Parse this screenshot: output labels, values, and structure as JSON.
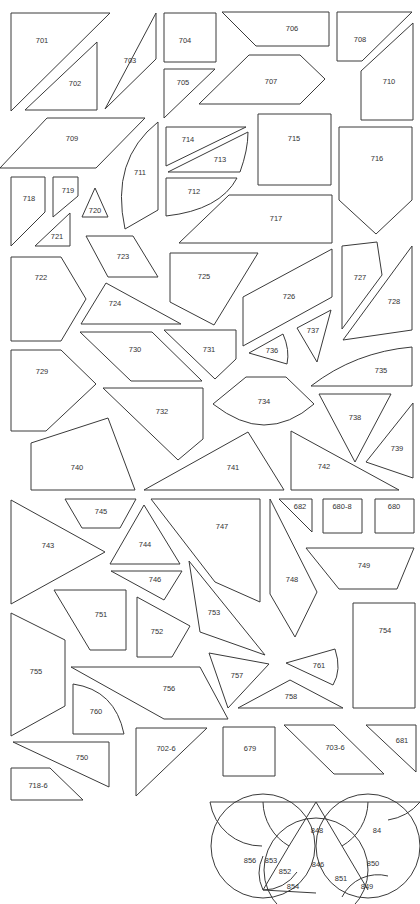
{
  "diagram": {
    "stroke_color": "#3a3a3a",
    "background": "#ffffff",
    "pieces": [
      {
        "id": "701",
        "points": "11,111 110,13 11,13",
        "lx": 42,
        "ly": 41
      },
      {
        "id": "702",
        "points": "25,110 97,42 97,110",
        "lx": 75,
        "ly": 84
      },
      {
        "id": "703",
        "points": "105,109 156,13 156,59",
        "lx": 130,
        "ly": 61
      },
      {
        "id": "704",
        "points": "164,13 216,13 216,62 164,62",
        "lx": 185,
        "ly": 41
      },
      {
        "id": "705",
        "points": "164,69 215,69 164,118",
        "lx": 183,
        "ly": 83
      },
      {
        "id": "706",
        "points": "222,12 329,12 329,46 256,46",
        "lx": 292,
        "ly": 29
      },
      {
        "id": "707",
        "points": "199,104 249,55 300,55 325,79 300,104",
        "lx": 271,
        "ly": 82
      },
      {
        "id": "708",
        "points": "337,12 412,12 362,61 337,61",
        "lx": 360,
        "ly": 40
      },
      {
        "id": "709",
        "points": "0,168 47,118 145,118 96,168",
        "lx": 72,
        "ly": 139
      },
      {
        "id": "710",
        "points": "361,71 413,23 413,120 361,120",
        "lx": 389,
        "ly": 82
      },
      {
        "id": "711",
        "points": "158,122 158,220",
        "curve": "M158,122 Q110,160 125,229 L158,210 Z",
        "lx": 140,
        "ly": 173
      },
      {
        "id": "712",
        "points": "166,178 237,178",
        "curve": "M166,178 L237,178 Q220,210 166,216 Z",
        "lx": 194,
        "ly": 192
      },
      {
        "id": "713",
        "points": "168,172 248,132",
        "curve": "M168,172 L240,172 Q248,150 248,132 Z",
        "lx": 220,
        "ly": 160
      },
      {
        "id": "714",
        "points": "166,127 246,127 166,166",
        "lx": 188,
        "ly": 140
      },
      {
        "id": "715",
        "points": "258,114 331,114 331,185 258,185",
        "lx": 294,
        "ly": 139
      },
      {
        "id": "716",
        "points": "339,127 412,127 412,200 376,234 339,200",
        "lx": 377,
        "ly": 159
      },
      {
        "id": "717",
        "points": "179,243 229,195 332,195 332,243",
        "lx": 276,
        "ly": 219
      },
      {
        "id": "718",
        "points": "11,177 45,177 45,212 11,246",
        "lx": 29,
        "ly": 199
      },
      {
        "id": "719",
        "points": "53,177 78,177 78,196 53,217",
        "lx": 68,
        "ly": 191
      },
      {
        "id": "720",
        "points": "82,217 95,188 108,217",
        "lx": 95,
        "ly": 211
      },
      {
        "id": "721",
        "points": "35,246 70,213 70,246",
        "lx": 57,
        "ly": 237
      },
      {
        "id": "722",
        "points": "11,257 61,257 86,299 61,341 11,341",
        "lx": 41,
        "ly": 278
      },
      {
        "id": "723",
        "points": "86,236 133,236 158,277 108,277",
        "lx": 123,
        "ly": 257
      },
      {
        "id": "724",
        "points": "81,324 106,283 181,324",
        "lx": 115,
        "ly": 304
      },
      {
        "id": "725",
        "points": "170,253 258,253 214,325 170,302",
        "lx": 204,
        "ly": 277
      },
      {
        "id": "726",
        "points": "243,346 243,297 332,249 332,297",
        "lx": 289,
        "ly": 297
      },
      {
        "id": "727",
        "points": "342,246 377,242 382,275 342,329",
        "lx": 360,
        "ly": 278
      },
      {
        "id": "728",
        "points": "343,340 412,246 412,330",
        "lx": 394,
        "ly": 302
      },
      {
        "id": "729",
        "points": "11,350 61,350 96,384 46,431 11,431",
        "lx": 42,
        "ly": 372
      },
      {
        "id": "730",
        "points": "80,332 152,332 202,381 131,381",
        "lx": 135,
        "ly": 350
      },
      {
        "id": "731",
        "points": "164,330 236,330 236,359 215,379",
        "lx": 209,
        "ly": 350
      },
      {
        "id": "732",
        "points": "103,388 203,388 203,439 178,460",
        "lx": 162,
        "ly": 412
      },
      {
        "id": "734",
        "points": "213,404",
        "curve": "M213,404 Q240,425 264,425 Q290,425 314,404 L286,377 L246,377 Z",
        "lx": 264,
        "ly": 402
      },
      {
        "id": "735",
        "points": "311,386 412,386",
        "curve": "M311,386 Q355,352 412,347 L412,386 Z",
        "lx": 381,
        "ly": 371
      },
      {
        "id": "736",
        "points": "249,353 283,334",
        "curve": "M249,353 L283,334 Q290,350 287,364 Z",
        "lx": 272,
        "ly": 351
      },
      {
        "id": "737",
        "points": "297,328 331,310 317,362",
        "lx": 313,
        "ly": 331
      },
      {
        "id": "738",
        "points": "319,394 391,394 355,462",
        "lx": 355,
        "ly": 418
      },
      {
        "id": "739",
        "points": "366,462 413,403 413,478",
        "lx": 397,
        "ly": 449
      },
      {
        "id": "740",
        "points": "31,443 108,418 135,490 31,490",
        "lx": 77,
        "ly": 468
      },
      {
        "id": "741",
        "points": "144,490 248,432 284,490",
        "lx": 233,
        "ly": 468
      },
      {
        "id": "742",
        "points": "291,431 291,490 399,490",
        "lx": 324,
        "ly": 467
      },
      {
        "id": "743",
        "points": "11,500 11,604 105,552",
        "lx": 48,
        "ly": 546
      },
      {
        "id": "744",
        "points": "110,564 144,505 180,564",
        "lx": 145,
        "ly": 545
      },
      {
        "id": "745",
        "points": "65,499 136,499 120,528 82,528",
        "lx": 101,
        "ly": 512
      },
      {
        "id": "746",
        "points": "111,571 182,571 164,600",
        "lx": 155,
        "ly": 580
      },
      {
        "id": "747",
        "points": "151,499 260,499 260,602 215,582",
        "lx": 222,
        "ly": 527
      },
      {
        "id": "748",
        "points": "270,499 317,592 295,637 270,594",
        "lx": 292,
        "ly": 580
      },
      {
        "id": "749",
        "points": "306,548 414,548 397,589 339,589",
        "lx": 364,
        "ly": 566
      },
      {
        "id": "751",
        "points": "54,590 126,590 126,650 90,650",
        "lx": 101,
        "ly": 615
      },
      {
        "id": "752",
        "points": "137,597 190,626 172,657 137,657",
        "lx": 157,
        "ly": 632
      },
      {
        "id": "753",
        "points": "189,561 265,655 200,632",
        "lx": 214,
        "ly": 613
      },
      {
        "id": "754",
        "points": "353,603 415,603 415,708 353,708",
        "lx": 385,
        "ly": 631
      },
      {
        "id": "755",
        "points": "11,613 65,640 65,706 11,736",
        "lx": 36,
        "ly": 672
      },
      {
        "id": "756",
        "points": "71,667 200,667 228,719 164,719",
        "lx": 169,
        "ly": 689
      },
      {
        "id": "757",
        "points": "209,653 269,664 228,708",
        "lx": 237,
        "ly": 676
      },
      {
        "id": "758",
        "points": "238,708 290,680 343,708",
        "lx": 291,
        "ly": 697
      },
      {
        "id": "760",
        "points": "73,694",
        "curve": "M73,684 Q115,690 124,734 L73,734 Z",
        "lx": 96,
        "ly": 712
      },
      {
        "id": "761",
        "points": "286,663 335,649",
        "curve": "M286,663 L335,649 Q342,670 333,685 Z",
        "lx": 319,
        "ly": 666
      },
      {
        "id": "750",
        "points": "13,742 109,742 109,787",
        "lx": 82,
        "ly": 758
      },
      {
        "id": "702-6",
        "points": "136,728 207,728 136,796",
        "lx": 166,
        "ly": 749
      },
      {
        "id": "718-6",
        "points": "11,768 50,768 83,800 11,800",
        "lx": 38,
        "ly": 786
      },
      {
        "id": "679",
        "points": "223,727 275,727 275,776 223,776",
        "lx": 250,
        "ly": 749
      },
      {
        "id": "703-6",
        "points": "284,725 334,725 384,774 334,774",
        "lx": 335,
        "ly": 748
      },
      {
        "id": "681",
        "points": "366,725 416,725 416,772",
        "lx": 402,
        "ly": 741
      },
      {
        "id": "682",
        "points": "279,499 312,499 312,532",
        "lx": 300,
        "ly": 507
      },
      {
        "id": "680-8",
        "points": "323,499 362,499 362,533 323,533",
        "lx": 342,
        "ly": 507
      },
      {
        "id": "680",
        "points": "375,499 414,499 414,533 375,533",
        "lx": 394,
        "ly": 507
      }
    ],
    "rosette": {
      "labels": [
        {
          "id": "848",
          "lx": 317,
          "ly": 831
        },
        {
          "id": "84",
          "lx": 377,
          "ly": 831
        },
        {
          "id": "856",
          "lx": 250,
          "ly": 861
        },
        {
          "id": "853",
          "lx": 271,
          "ly": 861
        },
        {
          "id": "852",
          "lx": 285,
          "ly": 872
        },
        {
          "id": "846",
          "lx": 318,
          "ly": 865
        },
        {
          "id": "850",
          "lx": 373,
          "ly": 864
        },
        {
          "id": "851",
          "lx": 341,
          "ly": 879
        },
        {
          "id": "854",
          "lx": 293,
          "ly": 887
        },
        {
          "id": "849",
          "lx": 367,
          "ly": 887
        }
      ]
    }
  }
}
